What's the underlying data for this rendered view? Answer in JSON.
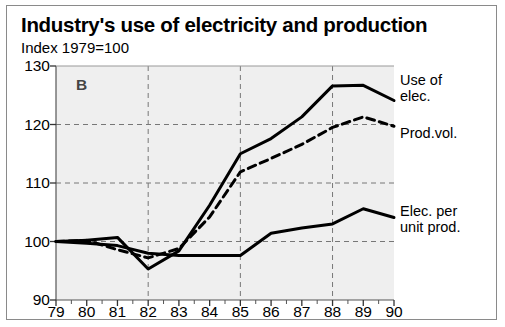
{
  "header": {
    "title": "Industry's use of electricity and production",
    "subtitle": "Index 1979=100"
  },
  "panel_marker": "B",
  "legend": [
    {
      "label_line1": "Use of",
      "label_line2": "elec."
    },
    {
      "label_line1": "Prod.vol.",
      "label_line2": ""
    },
    {
      "label_line1": "Elec. per",
      "label_line2": "unit prod."
    }
  ],
  "colors": {
    "ink": "#000000",
    "plot_background": "#efefef",
    "grid": "#777777",
    "frame": "#8a8a8a"
  },
  "chart_data": {
    "type": "line",
    "title": "Industry's use of electricity and production",
    "subtitle": "Index 1979=100",
    "xlabel": "",
    "ylabel": "",
    "categories": [
      "79",
      "80",
      "81",
      "82",
      "83",
      "84",
      "85",
      "86",
      "87",
      "88",
      "89",
      "90"
    ],
    "x": [
      79,
      80,
      81,
      82,
      83,
      84,
      85,
      86,
      87,
      88,
      89,
      90
    ],
    "ylim": [
      90,
      130
    ],
    "yticks": [
      90,
      100,
      110,
      120,
      130
    ],
    "grid": true,
    "legend_position": "right",
    "annotations": [
      {
        "text": "B",
        "x": 80,
        "y": 127.5
      }
    ],
    "series": [
      {
        "name": "Use of elec.",
        "style": "solid",
        "values": [
          100.0,
          100.2,
          100.7,
          95.3,
          98.4,
          106.2,
          115.0,
          117.6,
          121.3,
          126.6,
          126.7,
          124.1
        ]
      },
      {
        "name": "Prod.vol.",
        "style": "dashed",
        "values": [
          100.0,
          100.2,
          98.6,
          97.2,
          98.8,
          104.2,
          111.9,
          114.2,
          116.6,
          119.5,
          121.3,
          119.7
        ]
      },
      {
        "name": "Elec. per unit prod.",
        "style": "solid",
        "values": [
          100.0,
          99.7,
          99.3,
          98.0,
          97.6,
          97.6,
          97.6,
          101.4,
          102.3,
          103.0,
          105.6,
          104.1
        ]
      }
    ]
  }
}
